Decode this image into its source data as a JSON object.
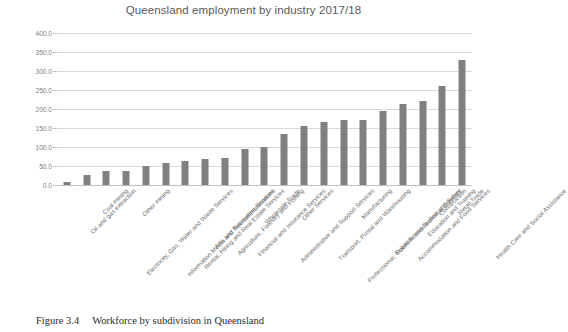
{
  "figure": {
    "caption_number": "Figure 3.4",
    "caption_text": "Workforce by subdivision in Queensland"
  },
  "chart_data": {
    "type": "bar",
    "title": "Queensland employment by industry 2017/18",
    "xlabel": "",
    "ylabel": "",
    "ylim": [
      0,
      400
    ],
    "ytick_step": 50,
    "grid": true,
    "legend": "none",
    "bar_color": "#808080",
    "gridline_color": "#d9d9d9",
    "title_color": "#595959",
    "tick_label_color": "#808080",
    "ytick_labels": [
      "400.0",
      "350.0",
      "300.0",
      "250.0",
      "200.0",
      "150.0",
      "100.0",
      "50.0",
      "0.0"
    ],
    "ytick_values": [
      400.0,
      350.0,
      300.0,
      250.0,
      200.0,
      150.0,
      100.0,
      50.0,
      0.0
    ],
    "categories": [
      "Oil and gas extraction",
      "Coal mining",
      "Electricity, Gas, Water and Waste Services",
      "Other mining",
      "Information Media and Telecommunications",
      "Rental, Hiring and Real Estate Services",
      "Arts and Recreation Services",
      "Agriculture, Forestry and Fishing",
      "Financial and Insurance Services",
      "Wholesale Trade",
      "Administrative and Support Services",
      "Other Services",
      "Transport, Postal and Warehousing",
      "Professional, Scientific and Technical Services",
      "Manufacturing",
      "Public Administration and Safety",
      "Accommodation and Food Services",
      "Education and Training",
      "Construction",
      "Retail Trade",
      "Health Care and Social Assistance"
    ],
    "values": [
      8,
      26,
      37,
      37,
      50,
      58,
      63,
      68,
      72,
      95,
      100,
      133,
      155,
      165,
      170,
      170,
      195,
      213,
      222,
      260,
      330
    ]
  }
}
